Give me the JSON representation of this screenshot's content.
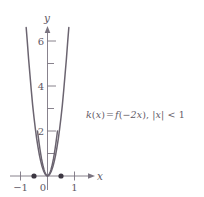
{
  "figure": {
    "annotation": {
      "full_text": "k(x) = f(−2x), |x| < 1",
      "function_name": "k",
      "arg_open": "(",
      "var1": "x",
      "arg_close": ")",
      "equals": "=",
      "inner_function": "f",
      "inner_open": "(",
      "inner_expr": "−2x",
      "inner_close": ")",
      "comma": ", ",
      "bar_open": "|",
      "var2": "x",
      "bar_close": "|",
      "less_than": " < ",
      "bound": "1"
    },
    "axes": {
      "x_label": "x",
      "y_label": "y",
      "x_ticks": [
        {
          "value": -1,
          "label": "−1"
        },
        {
          "value": 0,
          "label": "0"
        },
        {
          "value": 1,
          "label": "1"
        }
      ],
      "y_ticks": [
        {
          "value": 1,
          "label": ""
        },
        {
          "value": 2,
          "label": "2"
        },
        {
          "value": 3,
          "label": ""
        },
        {
          "value": 4,
          "label": "4"
        },
        {
          "value": 5,
          "label": ""
        },
        {
          "value": 6,
          "label": "6"
        }
      ]
    },
    "colors": {
      "curve": "#6b6470",
      "axis": "#7a7480",
      "text": "#5f5a66",
      "point_fill": "#3c3742",
      "background": "#ffffff"
    }
  },
  "chart_data": {
    "type": "line",
    "title": "",
    "xlabel": "x",
    "ylabel": "y",
    "xlim": [
      -1.35,
      1.35
    ],
    "ylim": [
      -0.55,
      6.9
    ],
    "grid": false,
    "legend": "none",
    "annotations": [
      {
        "text": "k(x) = f(−2x), |x| < 1",
        "x": 1.55,
        "y": 3.0
      }
    ],
    "xticks": [
      -1,
      0,
      1
    ],
    "xtick_labels": [
      "−1",
      "0",
      "1"
    ],
    "yticks": [
      1,
      2,
      3,
      4,
      5,
      6
    ],
    "ytick_labels": [
      "",
      "2",
      "",
      "4",
      "",
      "6"
    ],
    "series": [
      {
        "name": "outer-curve",
        "comment": "steep U-shaped branch rising to y=6 near x=±0.78; open valley touching y=0 at x=0",
        "x": [
          -0.79,
          -0.75,
          -0.7,
          -0.65,
          -0.6,
          -0.55,
          -0.5,
          -0.45,
          -0.4,
          -0.35,
          -0.3,
          -0.25,
          -0.2,
          -0.15,
          -0.1,
          -0.05,
          0.0,
          0.05,
          0.1,
          0.15,
          0.2,
          0.25,
          0.3,
          0.35,
          0.4,
          0.45,
          0.5,
          0.55,
          0.6,
          0.65,
          0.7,
          0.75,
          0.79
        ],
        "y": [
          6.6,
          6.0,
          5.2,
          4.5,
          3.8,
          3.15,
          2.6,
          2.1,
          1.65,
          1.27,
          0.93,
          0.65,
          0.42,
          0.24,
          0.11,
          0.03,
          0.0,
          0.03,
          0.11,
          0.24,
          0.42,
          0.65,
          0.93,
          1.27,
          1.65,
          2.1,
          2.6,
          3.15,
          3.8,
          4.5,
          5.2,
          6.0,
          6.6
        ]
      },
      {
        "name": "inner-curve",
        "comment": "narrow U-shaped branch topping at y=2 near x=±0.37, endpoints marked with filled dots at x=±0.5 on the axis",
        "x": [
          -0.37,
          -0.34,
          -0.31,
          -0.28,
          -0.25,
          -0.22,
          -0.19,
          -0.16,
          -0.13,
          -0.1,
          -0.07,
          -0.04,
          0.0,
          0.04,
          0.07,
          0.1,
          0.13,
          0.16,
          0.19,
          0.22,
          0.25,
          0.28,
          0.31,
          0.34,
          0.37
        ],
        "y": [
          2.0,
          1.72,
          1.45,
          1.2,
          0.97,
          0.76,
          0.58,
          0.42,
          0.29,
          0.18,
          0.09,
          0.04,
          0.0,
          0.04,
          0.09,
          0.18,
          0.29,
          0.42,
          0.58,
          0.76,
          0.97,
          1.2,
          1.45,
          1.72,
          2.0
        ]
      }
    ],
    "points": [
      {
        "name": "left-endpoint",
        "x": -0.5,
        "y": 0,
        "style": "filled-dot"
      },
      {
        "name": "right-endpoint",
        "x": 0.5,
        "y": 0,
        "style": "filled-dot"
      }
    ]
  }
}
